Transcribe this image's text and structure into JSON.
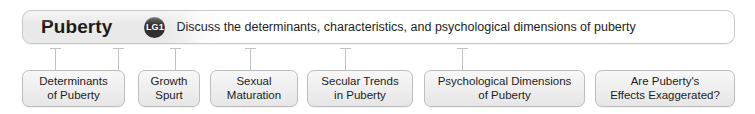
{
  "header": {
    "title": "Puberty",
    "badge_label": "LG1",
    "badge_name": "learning-goal-badge",
    "objective": "Discuss the determinants, characteristics, and psychological dimensions of puberty"
  },
  "topics": [
    {
      "label": "Determinants\nof Puberty",
      "left": 22,
      "width": 103
    },
    {
      "label": "Growth\nSpurt",
      "left": 138,
      "width": 62
    },
    {
      "label": "Sexual\nMaturation",
      "left": 210,
      "width": 88
    },
    {
      "label": "Secular Trends\nin Puberty",
      "left": 307,
      "width": 106
    },
    {
      "label": "Psychological Dimensions\nof Puberty",
      "left": 424,
      "width": 161
    },
    {
      "label": "Are Puberty's\nEffects Exaggerated?",
      "left": 595,
      "width": 140
    }
  ],
  "connectors": [
    55,
    118,
    175,
    250,
    345,
    462
  ],
  "colors": {
    "banner_gray": "#e9e9e9",
    "banner_white": "#ffffff",
    "border": "#c9c9c9",
    "badge_fill": "#332f2f",
    "badge_text": "#ffffff",
    "text": "#1d1d1d",
    "box_fill": "#eeeeee",
    "box_border": "#bdbdbd",
    "connector": "#c2c2c2"
  }
}
